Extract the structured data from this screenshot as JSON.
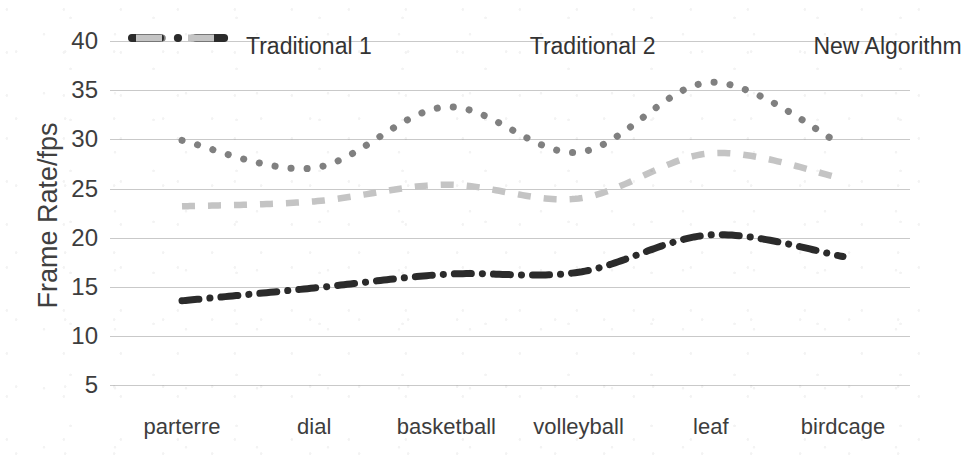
{
  "chart_data": {
    "type": "line",
    "title": "",
    "xlabel": "",
    "ylabel": "Frame Rate/fps",
    "categories": [
      "parterre",
      "dial",
      "basketball",
      "volleyball",
      "leaf",
      "birdcage"
    ],
    "yticks": [
      40,
      35,
      30,
      25,
      20,
      15,
      10,
      5
    ],
    "ylim": [
      5,
      40
    ],
    "grid": true,
    "legend_position": "top-inside",
    "series": [
      {
        "name": "Traditional 1",
        "style": "dotted",
        "color": "#808080",
        "values": [
          29.9,
          27.1,
          33.3,
          28.7,
          35.8,
          29.4
        ]
      },
      {
        "name": "Traditional 2",
        "style": "dash-dot",
        "color": "#2b2b2b",
        "values": [
          13.6,
          14.9,
          16.3,
          16.5,
          20.3,
          18.1
        ]
      },
      {
        "name": "New Algorithm",
        "style": "dashed",
        "color": "#c4c4c4",
        "values": [
          23.2,
          23.7,
          25.4,
          24.0,
          28.6,
          26.0
        ]
      }
    ]
  },
  "legend": {
    "items": [
      {
        "label": "Traditional 1",
        "swatch": "dotted-swatch"
      },
      {
        "label": "Traditional 2",
        "swatch": "dash-dot-swatch"
      },
      {
        "label": "New Algorithm",
        "swatch": "dashed-swatch"
      }
    ]
  },
  "axis": {
    "y_title": "Frame Rate/fps",
    "y_tick_labels": [
      "40",
      "35",
      "30",
      "25",
      "20",
      "15",
      "10",
      "5"
    ],
    "x_tick_labels": [
      "parterre",
      "dial",
      "basketball",
      "volleyball",
      "leaf",
      "birdcage"
    ]
  },
  "colors": {
    "traditional1": "#808080",
    "traditional2": "#2b2b2b",
    "new_algorithm": "#c4c4c4",
    "grid": "#c9c9c9",
    "text": "#3d3d3d",
    "background": "#ffffff"
  }
}
